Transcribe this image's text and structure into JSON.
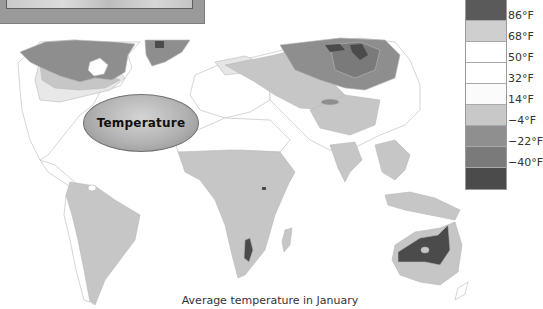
{
  "inset_photo": {
    "description": "photo-strip"
  },
  "map": {
    "label": "Temperature",
    "caption": "Average temperature in January",
    "palette": {
      "coldest": "#4a4a4a",
      "very_cold": "#7a7a7a",
      "cold": "#8e8e8e",
      "cool": "#c5c5c5",
      "mild": "#ffffff",
      "warm": "#c6c6c6",
      "hot": "#4e4e4e",
      "border": "#b5b5b5"
    }
  },
  "legend": {
    "swatches": [
      {
        "color": "#5a5a5a"
      },
      {
        "color": "#cfcfcf"
      },
      {
        "color": "#ffffff"
      },
      {
        "color": "#ffffff"
      },
      {
        "color": "#fbfbfb"
      },
      {
        "color": "#c8c8c8"
      },
      {
        "color": "#8f8f8f"
      },
      {
        "color": "#7a7a7a"
      },
      {
        "color": "#4b4b4b"
      }
    ],
    "labels": [
      "86°F",
      "68°F",
      "50°F",
      "32°F",
      "14°F",
      "−4°F",
      "−22°F",
      "−40°F"
    ]
  }
}
